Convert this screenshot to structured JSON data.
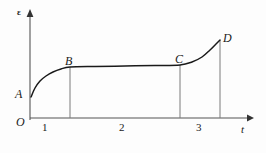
{
  "figure": {
    "background_color": "#fdfdfd",
    "line_color": "#1a1a1a",
    "axis_color": "#555555",
    "dropline_color": "#7a7a7a"
  },
  "axes": {
    "y_axis_label": "ε",
    "x_axis_label": "t",
    "origin_label": "O",
    "y_axis": {
      "x": 30,
      "y_top": 12,
      "y_bottom": 120
    },
    "x_axis": {
      "y": 118,
      "x_left": 30,
      "x_right": 252
    }
  },
  "points": [
    {
      "name": "A",
      "label": "A",
      "x": 31,
      "y": 97
    },
    {
      "name": "B",
      "label": "B",
      "x": 70,
      "y": 67
    },
    {
      "name": "C",
      "label": "C",
      "x": 180,
      "y": 65
    },
    {
      "name": "D",
      "label": "D",
      "x": 220,
      "y": 40
    }
  ],
  "region_labels": [
    {
      "label": "1",
      "x": 45
    },
    {
      "label": "2",
      "x": 122
    },
    {
      "label": "3",
      "x": 199
    }
  ],
  "chart_data": {
    "type": "line",
    "title": "",
    "xlabel": "t",
    "ylabel": "ε",
    "grid": false,
    "legend": null,
    "xlim": [
      0,
      1
    ],
    "ylim": [
      0,
      1
    ],
    "annotations": [
      {
        "text": "A",
        "x": 31,
        "y": 97,
        "note": "strain at instantaneous loading; start of primary creep"
      },
      {
        "text": "B",
        "x": 70,
        "y": 67,
        "note": "end of primary (transient) creep stage 1"
      },
      {
        "text": "C",
        "x": 180,
        "y": 65,
        "note": "end of secondary (steady-state) creep stage 2"
      },
      {
        "text": "D",
        "x": 220,
        "y": 40,
        "note": "rupture at end of tertiary creep stage 3"
      }
    ],
    "stage_labels": [
      "1",
      "2",
      "3"
    ],
    "series": [
      {
        "name": "creep-strain-curve",
        "description": "Classic three-stage creep curve: strain ε versus time t",
        "points": [
          {
            "x": 31,
            "y": 97
          },
          {
            "x": 35,
            "y": 88
          },
          {
            "x": 40,
            "y": 81
          },
          {
            "x": 46,
            "y": 76
          },
          {
            "x": 53,
            "y": 72
          },
          {
            "x": 61,
            "y": 69
          },
          {
            "x": 70,
            "y": 67
          },
          {
            "x": 95,
            "y": 66.4
          },
          {
            "x": 125,
            "y": 66.0
          },
          {
            "x": 155,
            "y": 65.5
          },
          {
            "x": 180,
            "y": 65
          },
          {
            "x": 192,
            "y": 62
          },
          {
            "x": 202,
            "y": 57
          },
          {
            "x": 210,
            "y": 50
          },
          {
            "x": 216,
            "y": 44
          },
          {
            "x": 220,
            "y": 40
          }
        ]
      }
    ],
    "droplines": [
      {
        "from_point": "B",
        "x": 70,
        "y_top": 67,
        "y_bottom": 118
      },
      {
        "from_point": "C",
        "x": 180,
        "y_top": 65,
        "y_bottom": 118
      },
      {
        "from_point": "D",
        "x": 220,
        "y_top": 40,
        "y_bottom": 118
      }
    ]
  }
}
